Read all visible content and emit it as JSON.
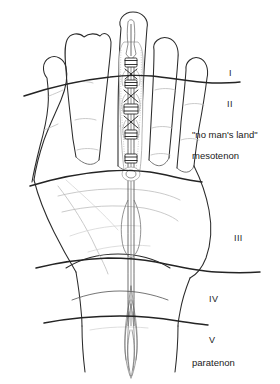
{
  "figure": {
    "background_color": "#ffffff",
    "line_color": "#2b2b2b",
    "faint_line_color": "#b8b8b8",
    "width": 280,
    "height": 384
  },
  "labels": {
    "zone_1": "I",
    "zone_2": "II",
    "no_mans_land": "\"no man's land\"",
    "mesotenon": "mesotenon",
    "zone_3": "III",
    "zone_4": "IV",
    "zone_5": "V",
    "paratenon": "paratenon"
  },
  "label_positions": [
    {
      "name": "zone-1",
      "text": "I",
      "x": 229,
      "y": 74
    },
    {
      "name": "zone-2",
      "text": "II",
      "x": 227,
      "y": 105
    },
    {
      "name": "no-mans-land",
      "text": "\"no man's land\"",
      "x": 193,
      "y": 136
    },
    {
      "name": "mesotenon",
      "text": "mesotenon",
      "x": 193,
      "y": 157
    },
    {
      "name": "zone-3",
      "text": "III",
      "x": 234,
      "y": 239
    },
    {
      "name": "zone-4",
      "text": "IV",
      "x": 210,
      "y": 300
    },
    {
      "name": "zone-5",
      "text": "V",
      "x": 209,
      "y": 341
    },
    {
      "name": "paratenon",
      "text": "paratenon",
      "x": 193,
      "y": 364
    }
  ],
  "zone_dividers": [
    {
      "name": "divider-I-II",
      "y": 78
    },
    {
      "name": "divider-II-III",
      "y": 175
    },
    {
      "name": "divider-III-IV",
      "y": 270
    },
    {
      "name": "divider-IV-V",
      "y": 322
    }
  ],
  "anatomy": {
    "digits": [
      "index-finger",
      "middle-finger",
      "ring-finger",
      "little-finger",
      "thumb"
    ],
    "detail_digit": "middle-finger",
    "structures": [
      "tendon-sheath",
      "annular-pulley",
      "cruciate-pulley",
      "mesotenon",
      "paratenon",
      "palm-creases"
    ]
  }
}
